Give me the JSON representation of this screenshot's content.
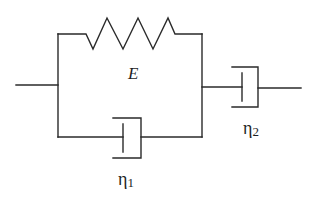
{
  "diagram": {
    "type": "rheological-model",
    "labels": {
      "spring": "E",
      "dashpot_parallel": {
        "symbol": "η",
        "subscript": "1"
      },
      "dashpot_series": {
        "symbol": "η",
        "subscript": "2"
      }
    },
    "colors": {
      "line": "#2a2a2a",
      "text": "#1e1e1e",
      "background": "#ffffff"
    },
    "elements": [
      {
        "id": "input-wire",
        "kind": "wire"
      },
      {
        "id": "spring-E",
        "kind": "spring",
        "label": "E"
      },
      {
        "id": "dashpot-eta1",
        "kind": "dashpot",
        "label": "η1",
        "arrangement": "parallel with spring"
      },
      {
        "id": "dashpot-eta2",
        "kind": "dashpot",
        "label": "η2",
        "arrangement": "series"
      },
      {
        "id": "output-wire",
        "kind": "wire"
      }
    ]
  }
}
